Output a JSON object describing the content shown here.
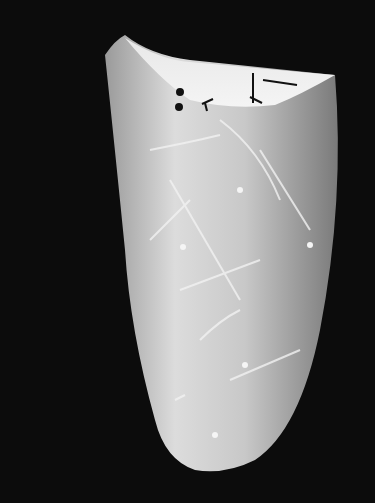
{
  "image": {
    "subject": "white porcelain vessel with incised line and dot decorations",
    "background_color": "#0c0c0c",
    "vessel_color": "#d8d8d8"
  }
}
